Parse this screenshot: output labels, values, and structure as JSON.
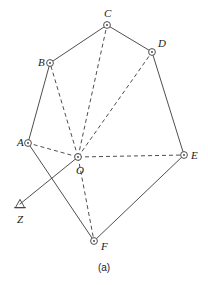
{
  "figure": {
    "caption": "(a)",
    "colors": {
      "stroke": "#3a3a3a",
      "label": "#1a1a1a",
      "background": "#ffffff"
    }
  },
  "chart_data": {
    "type": "scatter",
    "title": "(a)",
    "xlabel": "",
    "ylabel": "",
    "grid": false,
    "legend": false,
    "xlim": [
      0,
      208
    ],
    "ylim": [
      285,
      0
    ],
    "points": [
      {
        "name": "A",
        "x": 28,
        "y": 143,
        "label": "A",
        "label_dx": -11,
        "label_dy": -6,
        "marker": "circle-dot"
      },
      {
        "name": "B",
        "x": 50,
        "y": 63,
        "label": "B",
        "label_dx": -12,
        "label_dy": -6,
        "marker": "circle-dot"
      },
      {
        "name": "C",
        "x": 107,
        "y": 25,
        "label": "C",
        "label_dx": -3,
        "label_dy": -17,
        "marker": "circle-dot"
      },
      {
        "name": "D",
        "x": 152,
        "y": 52,
        "label": "D",
        "label_dx": 6,
        "label_dy": -14,
        "marker": "circle-dot"
      },
      {
        "name": "E",
        "x": 184,
        "y": 155,
        "label": "E",
        "label_dx": 7,
        "label_dy": -5,
        "marker": "circle-dot"
      },
      {
        "name": "F",
        "x": 94,
        "y": 241,
        "label": "F",
        "label_dx": 7,
        "label_dy": 0,
        "marker": "circle-dot"
      },
      {
        "name": "O",
        "x": 78,
        "y": 157,
        "label": "O",
        "label_dx": -2,
        "label_dy": 8,
        "marker": "circle-dot"
      },
      {
        "name": "Z",
        "x": 20,
        "y": 204,
        "label": "Z",
        "label_dx": -3,
        "label_dy": 10,
        "marker": "triangle-station"
      }
    ],
    "solid_edges": [
      {
        "from": "A",
        "to": "B"
      },
      {
        "from": "B",
        "to": "C"
      },
      {
        "from": "C",
        "to": "D"
      },
      {
        "from": "D",
        "to": "E"
      },
      {
        "from": "E",
        "to": "F"
      },
      {
        "from": "F",
        "to": "A"
      },
      {
        "from": "Z",
        "to": "O"
      }
    ],
    "dashed_edges": [
      {
        "from": "O",
        "to": "A"
      },
      {
        "from": "O",
        "to": "B"
      },
      {
        "from": "O",
        "to": "C"
      },
      {
        "from": "O",
        "to": "D"
      },
      {
        "from": "O",
        "to": "E"
      },
      {
        "from": "O",
        "to": "F"
      }
    ]
  }
}
